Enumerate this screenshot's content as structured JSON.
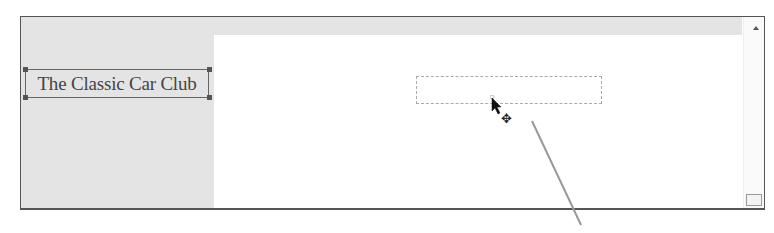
{
  "canvas": {
    "background": "#ffffff",
    "panel_gray": "#e4e4e4",
    "border_color": "#555555"
  },
  "selected_text_box": {
    "text": "The Classic Car Club",
    "rendered_text": "The Classiɐ Car Club",
    "state": "selected-with-handles"
  },
  "drop_placeholder": {
    "style": "dashed-outline"
  },
  "cursor": {
    "icons": [
      "arrow-pointer-icon",
      "move-icon"
    ],
    "move_glyph": "✥"
  },
  "scrollbar": {
    "up_arrow": "scroll-up-icon"
  },
  "callout_line": {
    "from": [
      532,
      121
    ],
    "to": [
      581,
      225
    ],
    "color": "#999999"
  }
}
